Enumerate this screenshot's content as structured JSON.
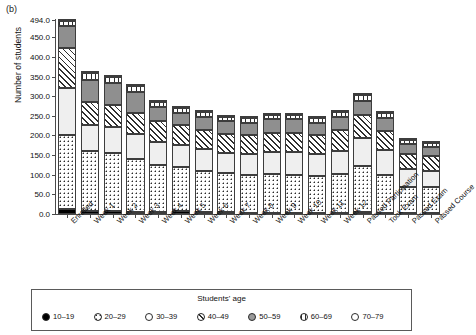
{
  "panel": {
    "label": "(b)"
  },
  "chart_data": {
    "type": "bar",
    "subtype": "stacked",
    "title": "",
    "xlabel": "",
    "ylabel": "Number of students",
    "ylim": [
      0,
      494
    ],
    "yticks": [
      "0.0",
      "50.0",
      "100.0",
      "150.0",
      "200.0",
      "250.0",
      "300.0",
      "350.0",
      "400.0",
      "450.0",
      "494.0"
    ],
    "ytick_values": [
      0,
      50,
      100,
      150,
      200,
      250,
      300,
      350,
      400,
      450,
      494
    ],
    "grid": false,
    "legend_position": "bottom",
    "legend_title": "Students' age",
    "categories": [
      "Enrolled",
      "Week 1",
      "Week 2",
      "Week 3",
      "Week 4",
      "Week 5",
      "Week 6",
      "Week 7",
      "Week 8",
      "Week 9",
      "Week 10",
      "Week 11",
      "Week 12",
      "Passed Participation",
      "Took Exam",
      "Passed Exam",
      "Passed Course"
    ],
    "series": [
      {
        "name": "10–19",
        "pattern": "solid-black",
        "values": [
          14,
          8,
          7,
          6,
          6,
          8,
          5,
          4,
          3,
          3,
          3,
          3,
          3,
          4,
          2,
          2,
          2
        ]
      },
      {
        "name": "20–29",
        "pattern": "dotted",
        "values": [
          186,
          152,
          148,
          134,
          118,
          112,
          104,
          100,
          96,
          98,
          96,
          94,
          100,
          118,
          98,
          68,
          66
        ]
      },
      {
        "name": "30–39",
        "pattern": "light-gray",
        "values": [
          122,
          66,
          66,
          64,
          60,
          56,
          56,
          52,
          54,
          56,
          58,
          56,
          58,
          72,
          62,
          44,
          42
        ]
      },
      {
        "name": "40–49",
        "pattern": "diagonal-hatch",
        "values": [
          102,
          60,
          56,
          54,
          52,
          50,
          50,
          48,
          48,
          50,
          50,
          48,
          52,
          58,
          50,
          40,
          38
        ]
      },
      {
        "name": "50–59",
        "pattern": "medium-gray",
        "values": [
          54,
          56,
          56,
          52,
          36,
          32,
          32,
          32,
          32,
          34,
          34,
          32,
          34,
          36,
          32,
          24,
          22
        ]
      },
      {
        "name": "60–69",
        "pattern": "vertical-lines",
        "values": [
          14,
          16,
          16,
          16,
          14,
          12,
          12,
          12,
          12,
          12,
          12,
          12,
          12,
          14,
          12,
          10,
          10
        ]
      },
      {
        "name": "70–79",
        "pattern": "white",
        "values": [
          2,
          2,
          2,
          2,
          2,
          2,
          2,
          2,
          2,
          2,
          2,
          2,
          2,
          2,
          2,
          2,
          2
        ]
      }
    ],
    "totals": [
      494,
      360,
      351,
      328,
      288,
      272,
      261,
      250,
      247,
      255,
      255,
      247,
      261,
      304,
      258,
      190,
      182
    ],
    "legend_entries": [
      "10–19",
      "20–29",
      "30–39",
      "40–49",
      "50–59",
      "60–69",
      "70–79"
    ]
  }
}
